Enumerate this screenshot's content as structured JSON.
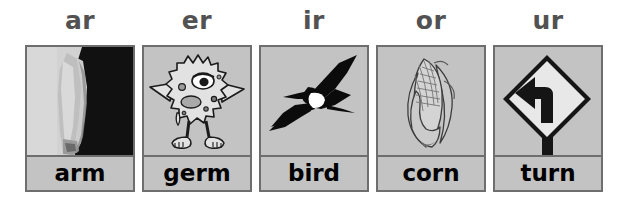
{
  "page": {
    "background_color": "#ffffff",
    "card_bg_color": "#c3c3c3",
    "card_border_color": "#6e6e6e",
    "header_text_color": "#525252",
    "word_text_color": "#000000"
  },
  "cards": [
    {
      "header": "ar",
      "word": "arm",
      "image": "arm-photo-icon",
      "image_description": "photograph of a bare human arm against a dark background"
    },
    {
      "header": "er",
      "word": "germ",
      "image": "germ-monster-icon",
      "image_description": "cartoon one-eyed spiky germ monster standing on two feet"
    },
    {
      "header": "ir",
      "word": "bird",
      "image": "bird-silhouette-icon",
      "image_description": "black frigatebird silhouette in flight with a white chest patch"
    },
    {
      "header": "or",
      "word": "corn",
      "image": "corn-cob-icon",
      "image_description": "line drawing of an ear of corn partly wrapped in its husk"
    },
    {
      "header": "ur",
      "word": "turn",
      "image": "left-turn-sign-icon",
      "image_description": "diamond shaped road sign with a left turn arrow on a post"
    }
  ]
}
